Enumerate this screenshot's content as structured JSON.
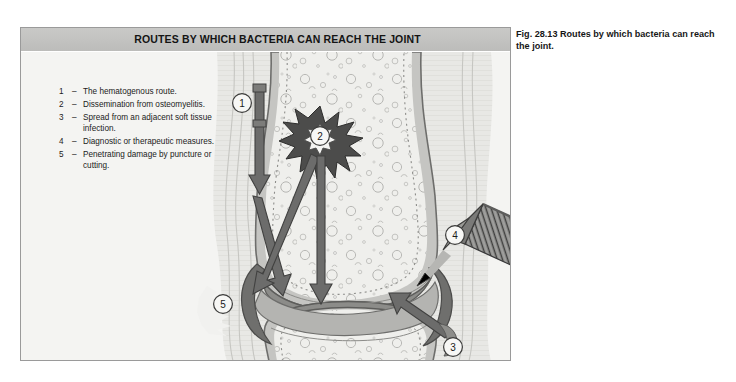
{
  "figure": {
    "panel_title": "ROUTES BY WHICH BACTERIA CAN REACH THE JOINT",
    "caption": "Fig. 28.13  Routes by which bacteria can reach the joint.",
    "caption_number": "Fig. 28.13",
    "caption_text": "Routes by which bacteria can reach the joint."
  },
  "legend": {
    "items": [
      {
        "num": "1",
        "dash": "–",
        "text": "The hematogenous route."
      },
      {
        "num": "2",
        "dash": "–",
        "text": "Dissemination from osteomyelitis."
      },
      {
        "num": "3",
        "dash": "–",
        "text": "Spread from an adjacent soft tissue infection."
      },
      {
        "num": "4",
        "dash": "–",
        "text": "Diagnostic or therapeutic measures."
      },
      {
        "num": "5",
        "dash": "–",
        "text": "Penetrating damage by puncture or cutting."
      }
    ]
  },
  "markers": [
    {
      "id": "1",
      "label": "1",
      "x": 221,
      "y": 75
    },
    {
      "id": "2",
      "label": "2",
      "x": 299,
      "y": 108
    },
    {
      "id": "3",
      "label": "3",
      "x": 432,
      "y": 319
    },
    {
      "id": "4",
      "label": "4",
      "x": 434,
      "y": 207
    },
    {
      "id": "5",
      "label": "5",
      "x": 202,
      "y": 276
    }
  ],
  "colors": {
    "panel_background": "#f4f4f2",
    "header_band": "#c4c4c2",
    "panel_border": "#9a9a9a",
    "bone_fill": "#ededea",
    "cortex_fill": "#c3c3c0",
    "cartilage_fill": "#8f8f8c",
    "arrow_fill": "#6f6f6e",
    "starburst_fill": "#4e4e4d",
    "syringe_body": "#6b6b6a",
    "text": "#161616",
    "page_background": "#ffffff"
  }
}
